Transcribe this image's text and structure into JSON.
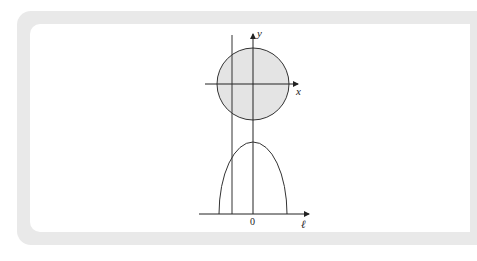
{
  "figure": {
    "top_panel": {
      "x_axis_label": "x",
      "y_axis_label": "y",
      "shape": "disk",
      "fill_color": "#e4e4e4",
      "stroke_color": "#333333",
      "vertical_line_offset": "left of y-axis"
    },
    "bottom_panel": {
      "horizontal_axis_label": "ℓ",
      "origin_label": "0",
      "curve": "semi-ellipse (chord length profile)"
    },
    "colors": {
      "frame": "#e9e9e9",
      "background": "#ffffff",
      "ink": "#333333"
    }
  }
}
